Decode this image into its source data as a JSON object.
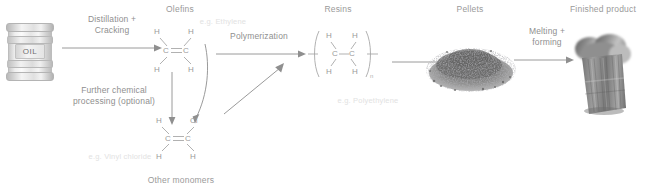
{
  "diagram": {
    "title_semantic": "plastic-production-process-flow",
    "background": "#ffffff",
    "text_color": "#8f8f8f",
    "faint_color": "#e2e2e2"
  },
  "stages": [
    {
      "id": "oil",
      "label": "OIL",
      "title": ""
    },
    {
      "id": "olefins",
      "title": "Olefins",
      "example": "e.g. Ethylene"
    },
    {
      "id": "monomers",
      "title": "Other monomers",
      "example": "e.g. Vinyl chloride"
    },
    {
      "id": "resins",
      "title": "Resins",
      "example": "e.g. Polyethylene"
    },
    {
      "id": "pellets",
      "title": "Pellets",
      "example": ""
    },
    {
      "id": "product",
      "title": "Finished product",
      "example": ""
    }
  ],
  "steps": [
    {
      "id": "step-1",
      "label": "Distillation +\nCracking"
    },
    {
      "id": "step-2",
      "label": "Further chemical\nprocessing (optional)"
    },
    {
      "id": "step-3",
      "label": "Polymerization"
    },
    {
      "id": "step-4",
      "label": "Melting +\nforming"
    }
  ],
  "molecules": {
    "ethylene": {
      "name": "ethylene",
      "bond": "C=C",
      "left_carbon": "C",
      "right_carbon": "C",
      "substituents": [
        "H",
        "H",
        "H",
        "H"
      ]
    },
    "vinyl_chloride": {
      "name": "vinyl-chloride",
      "bond": "C=C",
      "left_carbon": "C",
      "right_carbon": "C",
      "substituents": [
        "H",
        "Cl",
        "H",
        "H"
      ]
    },
    "polyethylene": {
      "name": "polyethylene-repeat-unit",
      "bond": "C-C",
      "left_carbon": "C",
      "right_carbon": "C",
      "substituents": [
        "H",
        "H",
        "H",
        "H"
      ],
      "subscript": "n"
    }
  }
}
